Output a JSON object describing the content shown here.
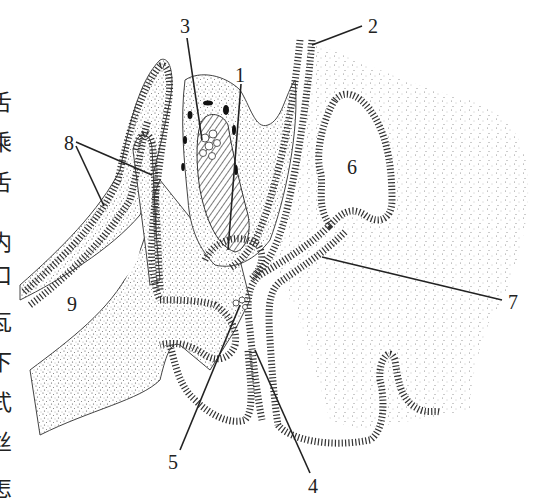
{
  "figure": {
    "type": "anatomical-section-diagram",
    "colors": {
      "ink": "#222222",
      "stipple": "#555555",
      "background": "#ffffff"
    },
    "labels": [
      {
        "id": "1",
        "text": "1",
        "x": 241,
        "y": 80
      },
      {
        "id": "2",
        "text": "2",
        "x": 370,
        "y": 33
      },
      {
        "id": "3",
        "text": "3",
        "x": 186,
        "y": 33
      },
      {
        "id": "4",
        "text": "4",
        "x": 314,
        "y": 490
      },
      {
        "id": "5",
        "text": "5",
        "x": 173,
        "y": 466
      },
      {
        "id": "6",
        "text": "6",
        "x": 352,
        "y": 173
      },
      {
        "id": "7",
        "text": "7",
        "x": 515,
        "y": 307
      },
      {
        "id": "8",
        "text": "8",
        "x": 69,
        "y": 148
      },
      {
        "id": "9",
        "text": "9",
        "x": 72,
        "y": 310
      }
    ],
    "edge_text": [
      "舌",
      "乘",
      "舌",
      "内",
      "口",
      "瓦",
      "下",
      "式",
      "丝",
      "怎"
    ]
  }
}
